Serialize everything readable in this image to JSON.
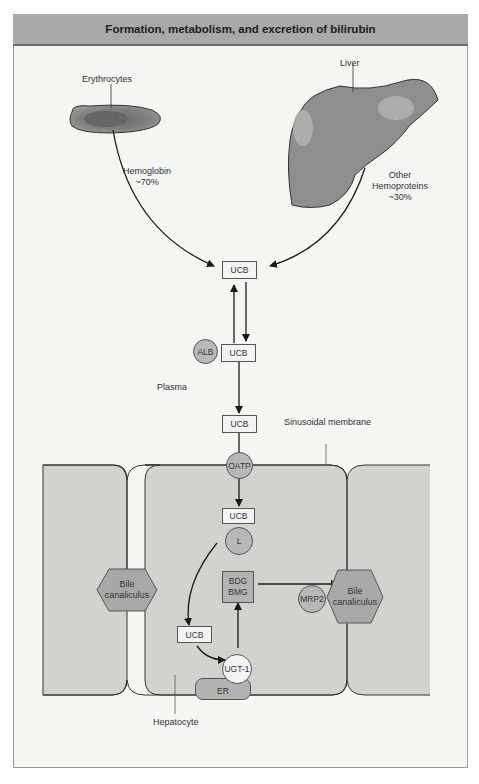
{
  "title": "Formation, metabolism, and excretion of bilirubin",
  "sources": {
    "erythrocytes": "Erythrocytes",
    "liver": "Liver",
    "hemoglobin_label": "Hemoglobin",
    "hemoglobin_pct": "~70%",
    "other_label_1": "Other",
    "other_label_2": "Hemoproteins",
    "other_pct": "~30%"
  },
  "plasma": {
    "ucb_top": "UCB",
    "alb": "ALB",
    "ucb_bound": "UCB",
    "plasma_label": "Plasma",
    "ucb_uptake": "UCB",
    "sinusoidal_membrane": "Sinusoidal membrane"
  },
  "hepatocyte": {
    "oatp": "OATP",
    "ucb_cytosol": "UCB",
    "ligandin": "L",
    "conjugates_1": "BDG",
    "conjugates_2": "BMG",
    "ucb_er": "UCB",
    "ugt": "UGT-1",
    "er": "ER",
    "mrp2": "MRP2",
    "bile_left_1": "Bile",
    "bile_left_2": "canaliculus",
    "bile_right_1": "Bile",
    "bile_right_2": "canaliculus",
    "hepatocyte_label": "Hepatocyte"
  },
  "colors": {
    "header_bg": "#a9a9a9",
    "cell_fill": "#d2d2d0",
    "organ_fill": "#8e8e8e",
    "line": "#2a2a2a"
  }
}
